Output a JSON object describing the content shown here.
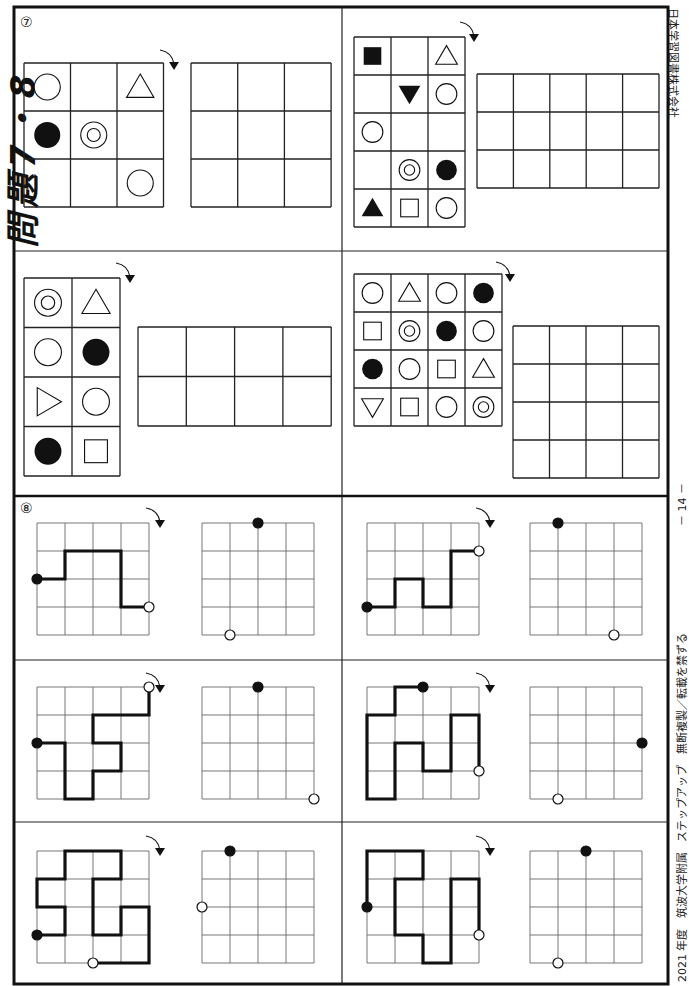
{
  "header": {
    "title_rotated": "問題7・8"
  },
  "side_footer": {
    "publisher": "日本学習図書株式会社",
    "page_number": "－ 14 －",
    "copyright": "無断複製／転載を禁ずる",
    "series": "ステップアップ",
    "school": "筑波大学附属",
    "year": "2021 年度"
  },
  "question7": {
    "label": "⑦",
    "icons": {
      "rotate": "rotate-arrow-icon"
    },
    "panels": [
      {
        "id": "q7-1",
        "rows": 3,
        "cols": 3,
        "cells": [
          [
            "circle",
            "",
            "triangle-up"
          ],
          [
            "filled-circle",
            "double-circle",
            ""
          ],
          [
            "",
            "",
            "circle"
          ]
        ],
        "answer_rows": 3,
        "answer_cols": 3
      },
      {
        "id": "q7-2",
        "rows": 5,
        "cols": 3,
        "cells": [
          [
            "filled-square",
            "",
            "triangle-up"
          ],
          [
            "",
            "filled-triangle-down",
            "circle"
          ],
          [
            "circle",
            "",
            ""
          ],
          [
            "",
            "double-circle",
            "filled-circle"
          ],
          [
            "filled-triangle-up",
            "square",
            "circle"
          ]
        ],
        "answer_rows": 3,
        "answer_cols": 5
      },
      {
        "id": "q7-3",
        "rows": 4,
        "cols": 2,
        "cells": [
          [
            "double-circle",
            "triangle-up"
          ],
          [
            "circle",
            "filled-circle"
          ],
          [
            "triangle-right",
            "circle"
          ],
          [
            "filled-circle",
            "square"
          ]
        ],
        "answer_rows": 2,
        "answer_cols": 4
      },
      {
        "id": "q7-4",
        "rows": 4,
        "cols": 4,
        "cells": [
          [
            "circle",
            "triangle-up",
            "circle",
            "filled-circle"
          ],
          [
            "square",
            "double-circle",
            "filled-circle",
            "circle"
          ],
          [
            "filled-circle",
            "circle",
            "square",
            "triangle-up"
          ],
          [
            "triangle-down",
            "square",
            "circle",
            "double-circle"
          ]
        ],
        "answer_rows": 4,
        "answer_cols": 4
      }
    ]
  },
  "question8": {
    "label": "⑧",
    "grid_size": 4,
    "mazes": [
      {
        "id": "q8-1",
        "path": [
          [
            0,
            2
          ],
          [
            1,
            2
          ],
          [
            1,
            1
          ],
          [
            3,
            1
          ],
          [
            3,
            3
          ],
          [
            4,
            3
          ]
        ],
        "start": [
          0,
          2
        ],
        "end": [
          4,
          3
        ],
        "answer_start": [
          2,
          0
        ],
        "answer_end": [
          1,
          4
        ]
      },
      {
        "id": "q8-2",
        "path": [
          [
            0,
            3
          ],
          [
            1,
            3
          ],
          [
            1,
            2
          ],
          [
            2,
            2
          ],
          [
            2,
            3
          ],
          [
            3,
            3
          ],
          [
            3,
            1
          ],
          [
            4,
            1
          ]
        ],
        "start": [
          0,
          3
        ],
        "end": [
          4,
          1
        ],
        "answer_start": [
          1,
          0
        ],
        "answer_end": [
          3,
          4
        ]
      },
      {
        "id": "q8-3",
        "path": [
          [
            0,
            2
          ],
          [
            1,
            2
          ],
          [
            1,
            4
          ],
          [
            2,
            4
          ],
          [
            2,
            3
          ],
          [
            3,
            3
          ],
          [
            3,
            2
          ],
          [
            2,
            2
          ],
          [
            2,
            1
          ],
          [
            4,
            1
          ],
          [
            4,
            0
          ]
        ],
        "start": [
          0,
          2
        ],
        "end": [
          4,
          0
        ],
        "answer_start": [
          2,
          0
        ],
        "answer_end": [
          4,
          4
        ]
      },
      {
        "id": "q8-4",
        "path": [
          [
            2,
            0
          ],
          [
            1,
            0
          ],
          [
            1,
            1
          ],
          [
            0,
            1
          ],
          [
            0,
            4
          ],
          [
            1,
            4
          ],
          [
            1,
            2
          ],
          [
            2,
            2
          ],
          [
            2,
            3
          ],
          [
            3,
            3
          ],
          [
            3,
            1
          ],
          [
            4,
            1
          ],
          [
            4,
            3
          ]
        ],
        "start": [
          2,
          0
        ],
        "end": [
          4,
          3
        ],
        "answer_start": [
          4,
          2
        ],
        "answer_end": [
          1,
          4
        ]
      },
      {
        "id": "q8-5",
        "path": [
          [
            0,
            3
          ],
          [
            1,
            3
          ],
          [
            1,
            2
          ],
          [
            0,
            2
          ],
          [
            0,
            1
          ],
          [
            1,
            1
          ],
          [
            1,
            0
          ],
          [
            3,
            0
          ],
          [
            3,
            1
          ],
          [
            2,
            1
          ],
          [
            2,
            3
          ],
          [
            3,
            3
          ],
          [
            3,
            2
          ],
          [
            4,
            2
          ],
          [
            4,
            4
          ],
          [
            2,
            4
          ]
        ],
        "start": [
          0,
          3
        ],
        "end": [
          2,
          4
        ],
        "answer_start": [
          1,
          0
        ],
        "answer_end": [
          0,
          2
        ]
      },
      {
        "id": "q8-6",
        "path": [
          [
            0,
            2
          ],
          [
            0,
            0
          ],
          [
            2,
            0
          ],
          [
            2,
            1
          ],
          [
            1,
            1
          ],
          [
            1,
            3
          ],
          [
            2,
            3
          ],
          [
            2,
            4
          ],
          [
            3,
            4
          ],
          [
            3,
            1
          ],
          [
            4,
            1
          ],
          [
            4,
            3
          ]
        ],
        "start": [
          0,
          2
        ],
        "end": [
          4,
          3
        ],
        "answer_start": [
          2,
          0
        ],
        "answer_end": [
          1,
          4
        ]
      }
    ]
  }
}
